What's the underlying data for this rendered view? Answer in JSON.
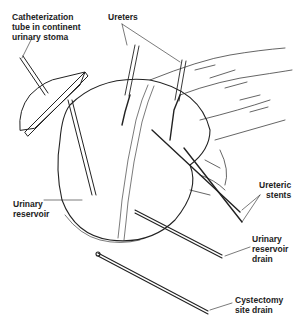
{
  "figure": {
    "labels": {
      "catheter_tube": "Catheterization\ntube in continent\nurinary stoma",
      "ureters": "Ureters",
      "ureteric_stents": "Ureteric\nstents",
      "urinary_reservoir": "Urinary\nreservoir",
      "reservoir_drain": "Urinary\nreservoir\ndrain",
      "cystectomy_drain": "Cystectomy\nsite drain"
    },
    "colors": {
      "line": "#222222",
      "background": "#ffffff"
    }
  }
}
